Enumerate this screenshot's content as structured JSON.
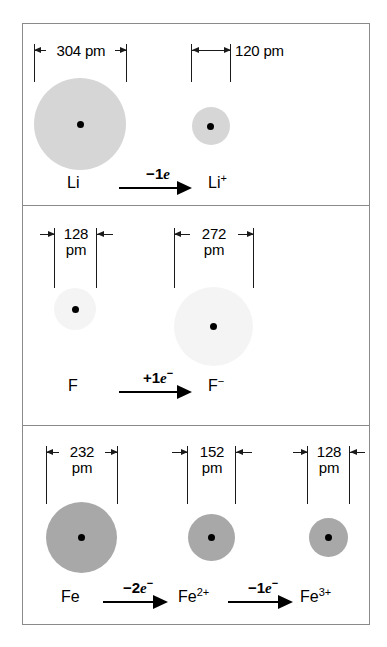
{
  "figure": {
    "units": "pm",
    "colors": {
      "frame": "#8a8a8a",
      "nucleus": "#000000",
      "li_fill": "#d6d6d6",
      "f_fill": "#f4f4f4",
      "fe_fill": "#a8a8a8",
      "ink": "#1a1a1a"
    }
  },
  "panels": [
    {
      "id": "lithium",
      "species": [
        {
          "name": "Li",
          "label": "Li",
          "charge": "",
          "dimension_value": "304",
          "dimension_unit": "pm",
          "dimension_text": "304 pm",
          "diameter_pm": 304,
          "fill": "#d6d6d6",
          "label_inside": true,
          "arrows": "outward"
        },
        {
          "name": "Li+",
          "label": "Li",
          "charge": "+",
          "dimension_value": "120",
          "dimension_unit": "pm",
          "dimension_text": "120 pm",
          "diameter_pm": 120,
          "fill": "#d6d6d6",
          "label_inside": false,
          "arrows": "inward-span"
        }
      ],
      "reaction": {
        "condition": "−1e",
        "condition_sign": "−",
        "condition_count": "1",
        "condition_particle": "e",
        "condition_superscript": ""
      }
    },
    {
      "id": "fluorine",
      "species": [
        {
          "name": "F",
          "label": "F",
          "charge": "",
          "dimension_value": "128",
          "dimension_unit": "pm",
          "dimension_text": "128 pm",
          "diameter_pm": 128,
          "fill": "#f4f4f4",
          "label_inside": true,
          "arrows": "inward"
        },
        {
          "name": "F-",
          "label": "F",
          "charge": "−",
          "dimension_value": "272",
          "dimension_unit": "pm",
          "dimension_text": "272 pm",
          "diameter_pm": 272,
          "fill": "#f4f4f4",
          "label_inside": true,
          "arrows": "outward"
        }
      ],
      "reaction": {
        "condition": "+1e−",
        "condition_sign": "+",
        "condition_count": "1",
        "condition_particle": "e",
        "condition_superscript": "−"
      }
    },
    {
      "id": "iron",
      "species": [
        {
          "name": "Fe",
          "label": "Fe",
          "charge": "",
          "dimension_value": "232",
          "dimension_unit": "pm",
          "dimension_text": "232 pm",
          "diameter_pm": 232,
          "fill": "#a8a8a8",
          "label_inside": true,
          "arrows": "outward"
        },
        {
          "name": "Fe2+",
          "label": "Fe",
          "charge": "2+",
          "dimension_value": "152",
          "dimension_unit": "pm",
          "dimension_text": "152 pm",
          "diameter_pm": 152,
          "fill": "#a8a8a8",
          "label_inside": true,
          "arrows": "inward"
        },
        {
          "name": "Fe3+",
          "label": "Fe",
          "charge": "3+",
          "dimension_value": "128",
          "dimension_unit": "pm",
          "dimension_text": "128 pm",
          "diameter_pm": 128,
          "fill": "#a8a8a8",
          "label_inside": true,
          "arrows": "inward"
        }
      ],
      "reactions": [
        {
          "condition": "−2e−",
          "condition_sign": "−",
          "condition_count": "2",
          "condition_particle": "e",
          "condition_superscript": "−"
        },
        {
          "condition": "−1e−",
          "condition_sign": "−",
          "condition_count": "1",
          "condition_particle": "e",
          "condition_superscript": "−"
        }
      ]
    }
  ]
}
